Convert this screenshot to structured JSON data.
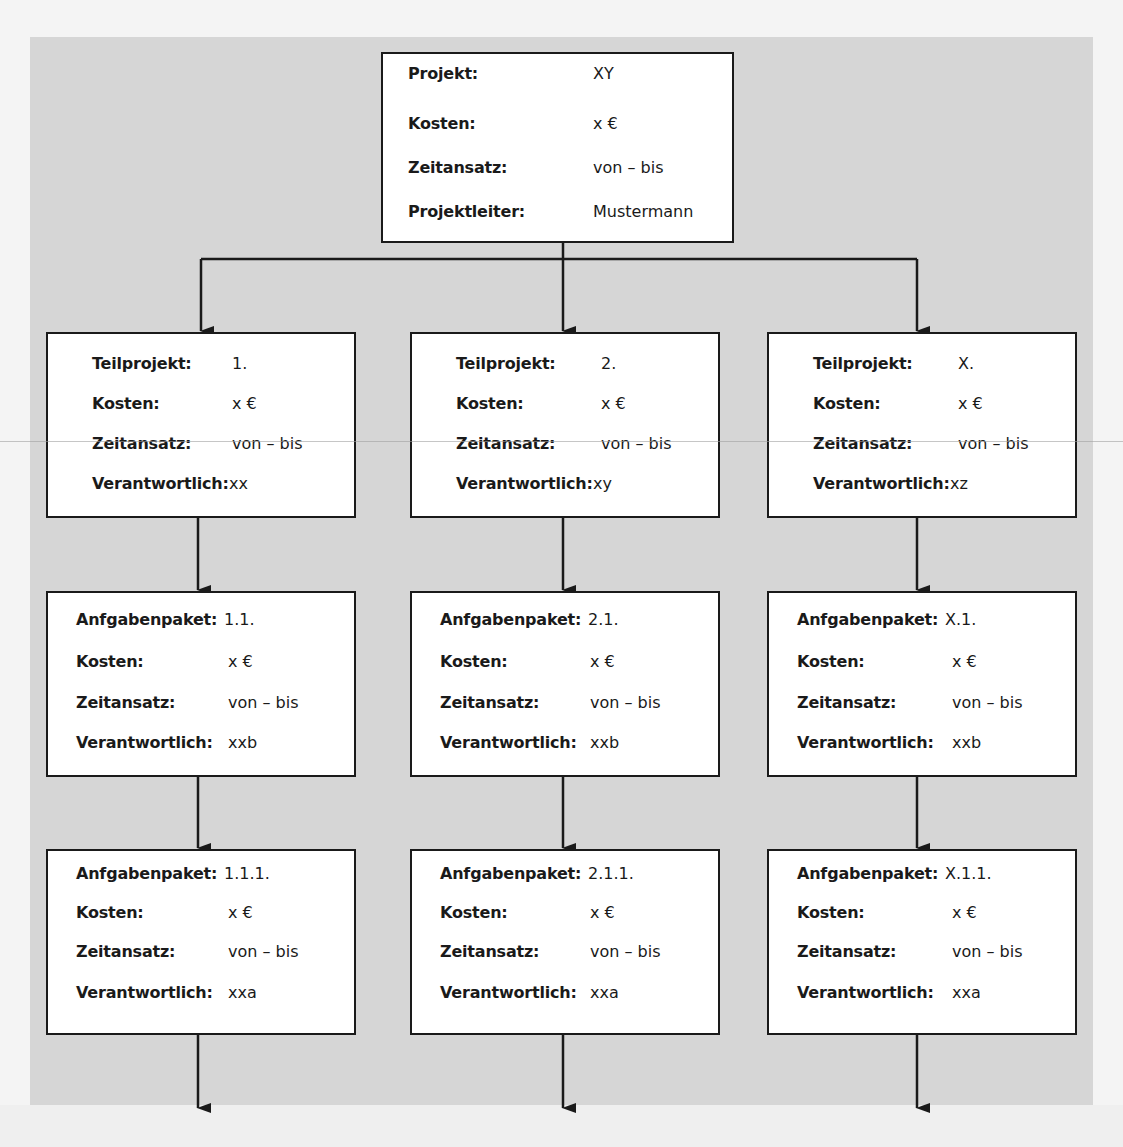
{
  "colors": {
    "panel": "#d6d6d6",
    "box": "#ffffff",
    "line": "#1a1a1a"
  },
  "root": {
    "rows": [
      {
        "label": "Projekt:",
        "value": "XY"
      },
      {
        "label": "Kosten:",
        "value": "x €"
      },
      {
        "label": "Zeitansatz:",
        "value": "von – bis"
      },
      {
        "label": "Projektleiter:",
        "value": "Mustermann"
      }
    ]
  },
  "columns": [
    {
      "teilprojekt": {
        "rows": [
          {
            "label": "Teilprojekt:",
            "value": "1."
          },
          {
            "label": "Kosten:",
            "value": "x €"
          },
          {
            "label": "Zeitansatz:",
            "value": "von – bis"
          },
          {
            "label": "Verantwortlich:",
            "value": "xx"
          }
        ]
      },
      "paket1": {
        "rows": [
          {
            "label": "Anfgabenpaket:",
            "value": "1.1."
          },
          {
            "label": "Kosten:",
            "value": "x €"
          },
          {
            "label": "Zeitansatz:",
            "value": "von – bis"
          },
          {
            "label": "Verantwortlich:",
            "value": "xxb"
          }
        ]
      },
      "paket2": {
        "rows": [
          {
            "label": "Anfgabenpaket:",
            "value": "1.1.1."
          },
          {
            "label": "Kosten:",
            "value": "x €"
          },
          {
            "label": "Zeitansatz:",
            "value": "von – bis"
          },
          {
            "label": "Verantwortlich:",
            "value": "xxa"
          }
        ]
      }
    },
    {
      "teilprojekt": {
        "rows": [
          {
            "label": "Teilprojekt:",
            "value": "2."
          },
          {
            "label": "Kosten:",
            "value": "x €"
          },
          {
            "label": "Zeitansatz:",
            "value": "von – bis"
          },
          {
            "label": "Verantwortlich:",
            "value": "xy"
          }
        ]
      },
      "paket1": {
        "rows": [
          {
            "label": "Anfgabenpaket:",
            "value": "2.1."
          },
          {
            "label": "Kosten:",
            "value": "x €"
          },
          {
            "label": "Zeitansatz:",
            "value": "von – bis"
          },
          {
            "label": "Verantwortlich:",
            "value": "xxb"
          }
        ]
      },
      "paket2": {
        "rows": [
          {
            "label": "Anfgabenpaket:",
            "value": "2.1.1."
          },
          {
            "label": "Kosten:",
            "value": "x €"
          },
          {
            "label": "Zeitansatz:",
            "value": "von – bis"
          },
          {
            "label": "Verantwortlich:",
            "value": "xxa"
          }
        ]
      }
    },
    {
      "teilprojekt": {
        "rows": [
          {
            "label": "Teilprojekt:",
            "value": "X."
          },
          {
            "label": "Kosten:",
            "value": "x €"
          },
          {
            "label": "Zeitansatz:",
            "value": "von – bis"
          },
          {
            "label": "Verantwortlich:",
            "value": "xz"
          }
        ]
      },
      "paket1": {
        "rows": [
          {
            "label": "Anfgabenpaket:",
            "value": "X.1."
          },
          {
            "label": "Kosten:",
            "value": "x €"
          },
          {
            "label": "Zeitansatz:",
            "value": "von – bis"
          },
          {
            "label": "Verantwortlich:",
            "value": "xxb"
          }
        ]
      },
      "paket2": {
        "rows": [
          {
            "label": "Anfgabenpaket:",
            "value": "X.1.1."
          },
          {
            "label": "Kosten:",
            "value": "x €"
          },
          {
            "label": "Zeitansatz:",
            "value": "von – bis"
          },
          {
            "label": "Verantwortlich:",
            "value": "xxa"
          }
        ]
      }
    }
  ]
}
